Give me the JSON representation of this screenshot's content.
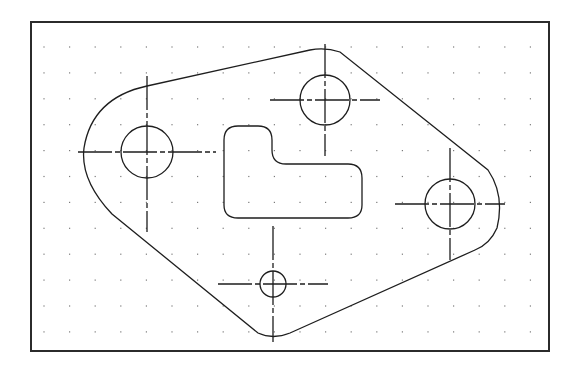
{
  "drawing": {
    "title": "Gasket plate with holes",
    "frame": {
      "x": 31,
      "y": 22,
      "width": 518,
      "height": 329
    },
    "colors": {
      "line": "#1e1e1e",
      "frame": "#2b2b2b",
      "grid": "#7a7a7a",
      "background": "#ffffff"
    },
    "grid": {
      "x_start": 44,
      "y_start": 47,
      "dx": 25.6,
      "dy": 25.9,
      "cols": 20,
      "rows": 12
    },
    "holes": [
      {
        "id": "left-hole",
        "cx": 147,
        "cy": 152,
        "r": 26,
        "crosshair": {
          "h": [
            78,
            216
          ],
          "v": [
            76,
            232
          ]
        }
      },
      {
        "id": "top-hole",
        "cx": 325,
        "cy": 100,
        "r": 25,
        "crosshair": {
          "h": [
            270,
            380
          ],
          "v": [
            44,
            156
          ]
        }
      },
      {
        "id": "right-hole",
        "cx": 450,
        "cy": 204,
        "r": 25,
        "crosshair": {
          "h": [
            395,
            505
          ],
          "v": [
            148,
            260
          ]
        }
      },
      {
        "id": "small-bottom-hole",
        "cx": 273,
        "cy": 284,
        "r": 13,
        "crosshair": {
          "h": [
            218,
            328
          ],
          "v": [
            226,
            342
          ]
        }
      }
    ],
    "outline_path": "M 147 86 L 310 50 Q 325 47 340 52 L 488 170 Q 505 195 497 228 Q 490 244 475 250 L 290 333 Q 273 340 258 333 L 112 214 Q 80 180 84 148 Q 92 98 147 86 Z",
    "slot_path": "M 224 140 Q 224 126 238 126 L 258 126 Q 272 126 272 140 L 272 150 Q 272 164 286 164 L 348 164 Q 362 164 362 178 L 362 205 Q 362 218 348 218 L 238 218 Q 224 218 224 205 Z"
  }
}
